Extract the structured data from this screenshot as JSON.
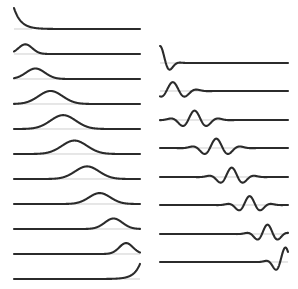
{
  "figure": {
    "background_color": "#ffffff",
    "trace_color": "#2b2b2b",
    "baseline_color": "#b9b9b9",
    "trace_line_width": 2.1,
    "baseline_line_width": 0.7,
    "width": 298,
    "height": 289
  },
  "chart_data": {
    "type": "line",
    "subtitle": "",
    "xlabel": "",
    "ylabel": "",
    "grid": false,
    "legend": "none",
    "axis_ticks": "none",
    "axis_tick_labels": [],
    "annotations": [],
    "panels": [
      {
        "name": "left-column",
        "description": "Monophasic pulse traces: peak migrates left-to-right, amplitude rises then falls, width broadens then narrows",
        "x_origin": 14,
        "x_end": 140,
        "row_count": 11,
        "row_spacing": 25.0,
        "first_baseline_y": 29,
        "xlim": [
          0,
          1
        ],
        "ylim": [
          -0.1,
          1.05
        ],
        "series": [
          {
            "name": "trace-1",
            "shape": "decaying-exponential",
            "peak_x": 0.0,
            "peak_amplitude": 1.0,
            "width": 0.055,
            "baseline_y": 29
          },
          {
            "name": "trace-2",
            "shape": "gaussian-pulse",
            "peak_x": 0.09,
            "peak_amplitude": 0.46,
            "width": 0.055,
            "baseline_y": 54
          },
          {
            "name": "trace-3",
            "shape": "gaussian-pulse",
            "peak_x": 0.17,
            "peak_amplitude": 0.5,
            "width": 0.075,
            "baseline_y": 79
          },
          {
            "name": "trace-4",
            "shape": "gaussian-pulse",
            "peak_x": 0.29,
            "peak_amplitude": 0.62,
            "width": 0.095,
            "baseline_y": 104
          },
          {
            "name": "trace-5",
            "shape": "gaussian-pulse",
            "peak_x": 0.39,
            "peak_amplitude": 0.66,
            "width": 0.1,
            "baseline_y": 129
          },
          {
            "name": "trace-6",
            "shape": "gaussian-pulse",
            "peak_x": 0.48,
            "peak_amplitude": 0.64,
            "width": 0.1,
            "baseline_y": 154
          },
          {
            "name": "trace-7",
            "shape": "gaussian-pulse",
            "peak_x": 0.58,
            "peak_amplitude": 0.6,
            "width": 0.095,
            "baseline_y": 179
          },
          {
            "name": "trace-8",
            "shape": "gaussian-pulse",
            "peak_x": 0.68,
            "peak_amplitude": 0.52,
            "width": 0.085,
            "baseline_y": 204
          },
          {
            "name": "trace-9",
            "shape": "gaussian-pulse",
            "peak_x": 0.79,
            "peak_amplitude": 0.5,
            "width": 0.07,
            "baseline_y": 229
          },
          {
            "name": "trace-10",
            "shape": "gaussian-pulse",
            "peak_x": 0.89,
            "peak_amplitude": 0.52,
            "width": 0.055,
            "baseline_y": 254
          },
          {
            "name": "trace-11",
            "shape": "rising-exponential",
            "peak_x": 1.0,
            "peak_amplitude": 0.72,
            "width": 0.05,
            "baseline_y": 279
          }
        ]
      },
      {
        "name": "right-column",
        "description": "Damped oscillatory wavelet traces: oscillation packet migrates left-to-right, ringing decays away from center",
        "x_origin": 160,
        "x_end": 288,
        "row_count": 8,
        "row_spacing": 28.5,
        "first_baseline_y": 63,
        "xlim": [
          0,
          1
        ],
        "ylim": [
          -0.8,
          1.0
        ],
        "series": [
          {
            "name": "wavelet-1",
            "center_x": 0.0,
            "peak_amplitude": 1.0,
            "decay": 0.06,
            "frequency": 11.0,
            "baseline_y": 63
          },
          {
            "name": "wavelet-2",
            "center_x": 0.1,
            "peak_amplitude": 0.52,
            "decay": 0.1,
            "frequency": 10.0,
            "baseline_y": 91
          },
          {
            "name": "wavelet-3",
            "center_x": 0.27,
            "peak_amplitude": 0.55,
            "decay": 0.1,
            "frequency": 10.0,
            "baseline_y": 120
          },
          {
            "name": "wavelet-4",
            "center_x": 0.44,
            "peak_amplitude": 0.55,
            "decay": 0.1,
            "frequency": 10.0,
            "baseline_y": 148
          },
          {
            "name": "wavelet-5",
            "center_x": 0.56,
            "peak_amplitude": 0.55,
            "decay": 0.09,
            "frequency": 10.5,
            "baseline_y": 177
          },
          {
            "name": "wavelet-6",
            "center_x": 0.7,
            "peak_amplitude": 0.52,
            "decay": 0.085,
            "frequency": 11.0,
            "baseline_y": 205
          },
          {
            "name": "wavelet-7",
            "center_x": 0.84,
            "peak_amplitude": 0.55,
            "decay": 0.08,
            "frequency": 11.5,
            "baseline_y": 234
          },
          {
            "name": "wavelet-8",
            "center_x": 0.98,
            "peak_amplitude": 0.85,
            "decay": 0.07,
            "frequency": 12.0,
            "baseline_y": 262
          }
        ]
      }
    ]
  }
}
